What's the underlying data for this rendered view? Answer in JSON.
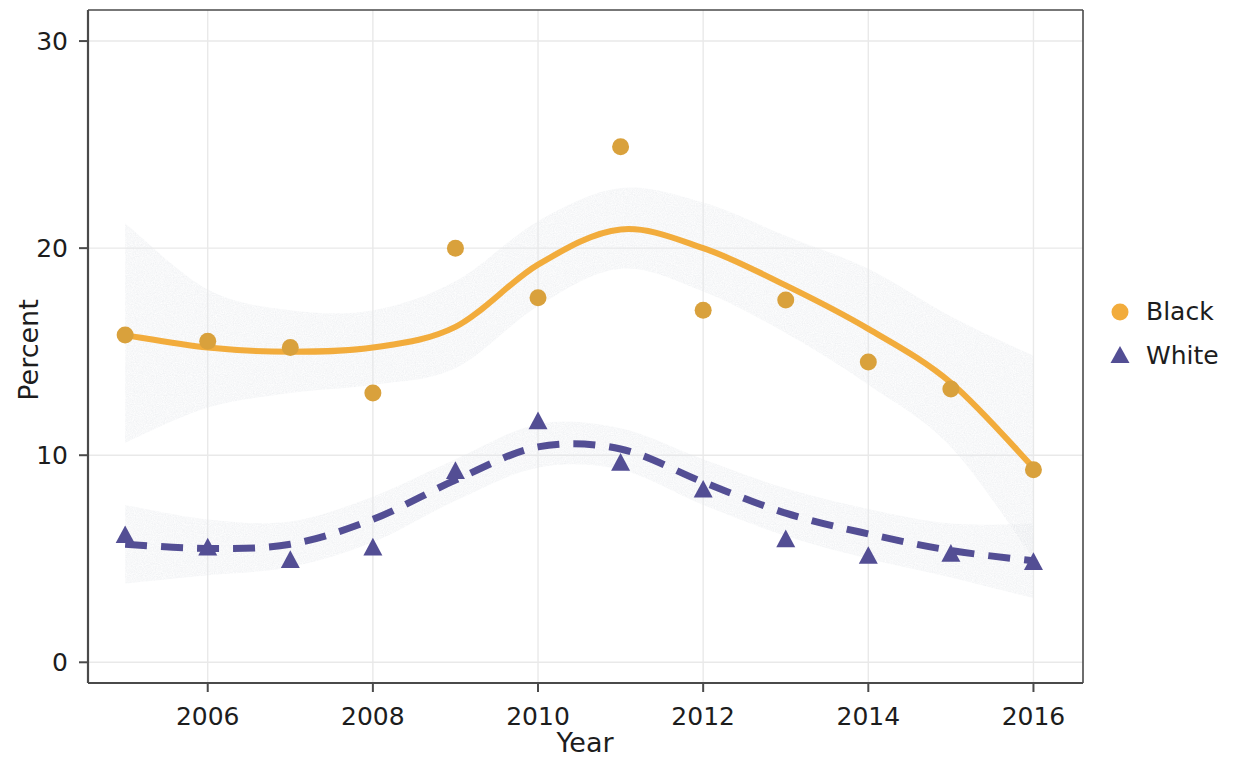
{
  "chart_data": {
    "type": "line",
    "title": "",
    "xlabel": "Year",
    "ylabel": "Percent",
    "xlim": [
      2004.55,
      2016.6
    ],
    "ylim": [
      -1.0,
      31.5
    ],
    "xticks": [
      "2006",
      "2008",
      "2010",
      "2012",
      "2014",
      "2016"
    ],
    "xtick_values": [
      2006,
      2008,
      2010,
      2012,
      2014,
      2016
    ],
    "yticks": [
      "0",
      "10",
      "20",
      "30"
    ],
    "ytick_values": [
      0,
      10,
      20,
      30
    ],
    "grid": true,
    "grid_color": "#e8e8e8",
    "legend_position": "right",
    "band_label": "95% confidence band",
    "band_color": "#c9ccd1",
    "x": [
      2005,
      2006,
      2007,
      2008,
      2009,
      2010,
      2011,
      2012,
      2013,
      2014,
      2015,
      2016
    ],
    "series": [
      {
        "name": "Black",
        "color": "#f2ac3c",
        "marker": "circle",
        "linestyle": "solid",
        "values": [
          15.8,
          15.5,
          15.2,
          13.0,
          20.0,
          17.6,
          24.9,
          17.0,
          17.5,
          14.5,
          13.2,
          9.3
        ],
        "fit": [
          15.8,
          15.2,
          15.0,
          15.2,
          16.2,
          19.2,
          20.9,
          20.0,
          18.2,
          16.1,
          13.5,
          9.4
        ],
        "fit_lower": [
          10.6,
          12.3,
          13.0,
          13.4,
          14.2,
          17.2,
          19.0,
          17.9,
          15.9,
          13.4,
          10.4,
          5.0
        ],
        "fit_upper": [
          21.2,
          18.0,
          17.0,
          17.0,
          18.4,
          21.3,
          22.9,
          22.2,
          20.6,
          19.0,
          16.7,
          14.8
        ]
      },
      {
        "name": "White",
        "color": "#534e94",
        "marker": "triangle",
        "linestyle": "dashed",
        "values": [
          6.1,
          5.5,
          4.9,
          5.5,
          9.2,
          11.6,
          9.6,
          8.3,
          5.9,
          5.1,
          5.2,
          4.8
        ],
        "fit": [
          5.7,
          5.5,
          5.7,
          6.9,
          8.8,
          10.4,
          10.3,
          8.7,
          7.2,
          6.2,
          5.4,
          4.9
        ],
        "fit_lower": [
          3.8,
          4.2,
          4.6,
          5.8,
          7.8,
          9.4,
          9.3,
          7.6,
          6.1,
          5.0,
          4.1,
          3.1
        ],
        "fit_upper": [
          7.6,
          6.9,
          6.8,
          8.0,
          9.8,
          11.5,
          11.3,
          9.8,
          8.4,
          7.4,
          6.7,
          6.7
        ]
      }
    ]
  },
  "legend": {
    "items": [
      {
        "label": "Black",
        "marker": "circle",
        "color": "#f2ac3c"
      },
      {
        "label": "White",
        "marker": "triangle",
        "color": "#534e94"
      }
    ]
  },
  "axes": {
    "x_title": "Year",
    "y_title": "Percent"
  }
}
